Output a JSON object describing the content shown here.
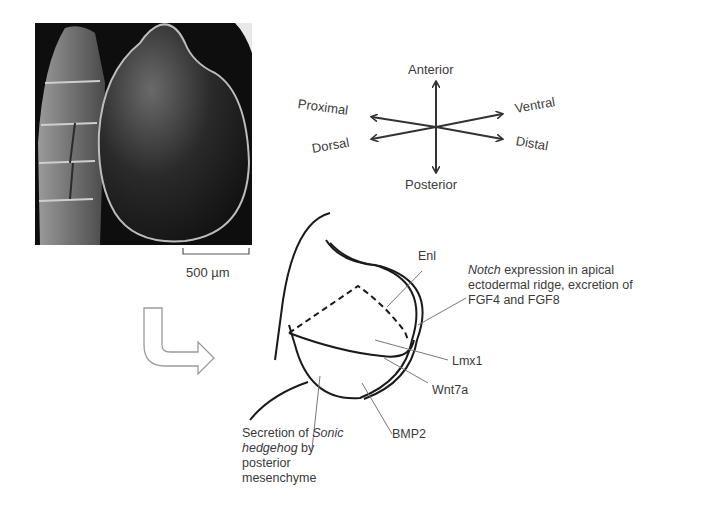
{
  "figure": {
    "panel_photo": {
      "description": "scanning-electron-micrograph of embryonic limb bud beside somites",
      "scale_bar_label": "500 µm"
    },
    "axes_compass": {
      "up": "Anterior",
      "down": "Posterior",
      "upper_left": "Proximal",
      "lower_left": "Dorsal",
      "upper_right": "Ventral",
      "lower_right": "Distal"
    },
    "transition_arrow": "hollow-bent-arrow",
    "schematic": {
      "labels": {
        "enl": "Enl",
        "notch_italic": "Notch",
        "notch_rest_line1": " expression  in apical",
        "notch_line2": "ectodermal  ridge, excretion of",
        "notch_line3": "FGF4 and FGF8",
        "lmx1": "Lmx1",
        "wnt7a": "Wnt7a",
        "bmp2": "BMP2",
        "shh_line1_a": "Secretion of ",
        "shh_line1_italic": "Sonic",
        "shh_line2_italic": "hedgehog",
        "shh_line2_rest": " by",
        "shh_line3": "posterior",
        "shh_line4": "mesenchyme"
      }
    }
  }
}
